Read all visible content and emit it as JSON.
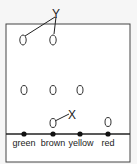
{
  "diagram": {
    "labels": {
      "y": "Y",
      "x": "X"
    },
    "positions": [
      {
        "name": "green",
        "label": "green",
        "x": 24
      },
      {
        "name": "brown",
        "label": "brown",
        "x": 53
      },
      {
        "name": "yellow",
        "label": "yellow",
        "x": 80
      },
      {
        "name": "red",
        "label": "red",
        "x": 108
      }
    ],
    "colors": {
      "background": "#f6f6f6",
      "box_fill": "#ffffff",
      "stroke": "#222222"
    }
  }
}
